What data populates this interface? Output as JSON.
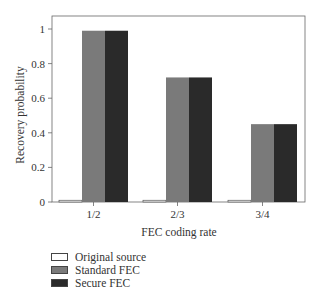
{
  "chart_data": {
    "type": "bar",
    "title": "",
    "xlabel": "FEC coding rate",
    "ylabel": "Recovery probability",
    "categories": [
      "1/2",
      "2/3",
      "3/4"
    ],
    "series": [
      {
        "name": "Original source",
        "values": [
          0.01,
          0.01,
          0.01
        ],
        "color": "#ffffff"
      },
      {
        "name": "Standard FEC",
        "values": [
          0.99,
          0.72,
          0.45
        ],
        "color": "#7a7a7a"
      },
      {
        "name": "Secure FEC",
        "values": [
          0.99,
          0.72,
          0.45
        ],
        "color": "#2a2a2a"
      }
    ],
    "ylim": [
      0,
      1.05
    ],
    "yticks": [
      0,
      0.2,
      0.4,
      0.6,
      0.8,
      1
    ],
    "ytick_labels": [
      "0",
      "0.2",
      "0.4",
      "0.6",
      "0.8",
      "1"
    ],
    "grid": false,
    "legend_position": "bottom-left outside"
  },
  "legend": {
    "items": [
      {
        "label": "Original source",
        "color": "#ffffff"
      },
      {
        "label": "Standard FEC",
        "color": "#7a7a7a"
      },
      {
        "label": "Secure FEC",
        "color": "#2a2a2a"
      }
    ]
  }
}
